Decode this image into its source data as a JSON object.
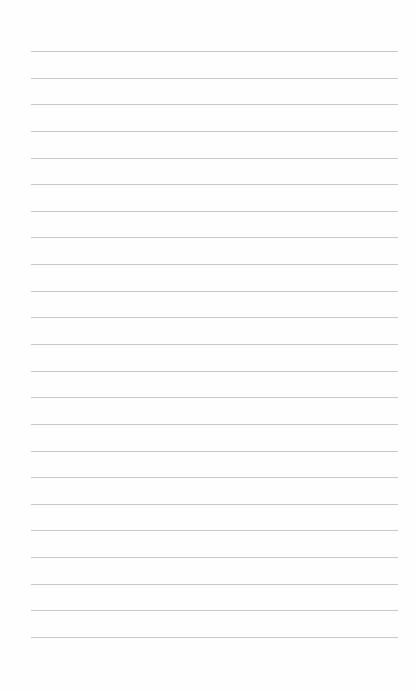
{
  "page": {
    "type": "blank lined paper",
    "background_color": "#fefefe",
    "rule_color": "#c9c9c9",
    "rule_count": 23,
    "first_rule_y": 51,
    "last_rule_y": 637,
    "rule_left_x": 31,
    "rule_right_x": 398
  }
}
